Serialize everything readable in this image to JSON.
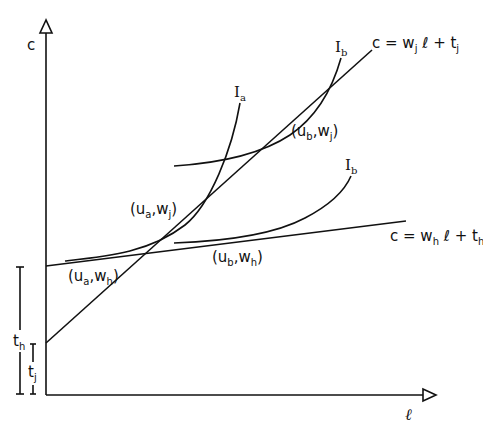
{
  "axes": {
    "y_label": "c",
    "x_label": "ℓ"
  },
  "lines": {
    "j": {
      "label_main": "c = w",
      "sub1": "j",
      "mid": " ℓ + t",
      "sub2": "j"
    },
    "h": {
      "label_main": "c = w",
      "sub1": "h",
      "mid": " ℓ + t",
      "sub2": "h"
    }
  },
  "curves": {
    "Ia": {
      "main": "I",
      "sub": "a"
    },
    "Ib_upper": {
      "main": "I",
      "sub": "b"
    },
    "Ib_lower": {
      "main": "I",
      "sub": "b"
    }
  },
  "points": {
    "ua_wj": {
      "open": "(u",
      "s1": "a",
      "mid": ",w",
      "s2": "j",
      "close": ")"
    },
    "ub_wj": {
      "open": "(u",
      "s1": "b",
      "mid": ",w",
      "s2": "j",
      "close": ")"
    },
    "ua_wh": {
      "open": "(u",
      "s1": "a",
      "mid": ",w",
      "s2": "h",
      "close": ")"
    },
    "ub_wh": {
      "open": "(u",
      "s1": "b",
      "mid": ",w",
      "s2": "h",
      "close": ")"
    }
  },
  "intercepts": {
    "th": {
      "main": "t",
      "sub": "h"
    },
    "tj": {
      "main": "t",
      "sub": "j"
    }
  }
}
